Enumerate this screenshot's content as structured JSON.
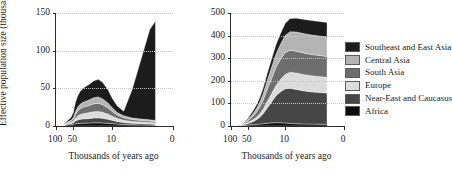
{
  "chart_data": {
    "type": "area",
    "layout": "two-panel stacked area, shared legend at right",
    "title": "",
    "grid": true,
    "legend_position": "right",
    "xlabel": "Thousands of years ago",
    "ylabel": "Effective population size (thousands)",
    "x_tick_labels": [
      "100",
      "50",
      "10",
      "0"
    ],
    "x_tick_values": [
      100,
      50,
      10,
      0
    ],
    "x_axis_note": "reversed, non-linear (log-like) time axis, oldest at left",
    "series_order_bottom_to_top": [
      "Africa",
      "Near-East and Caucasus",
      "Europe",
      "South Asia",
      "Central Asia",
      "Southeast and East Asia"
    ],
    "colors": {
      "Southeast and East Asia": "#1c1c1c",
      "Central Asia": "#b4b4b4",
      "South Asia": "#6e6e6e",
      "Europe": "#dcdcdc",
      "Near-East and Caucasus": "#464646",
      "Africa": "#0d0d0d"
    },
    "panels": [
      {
        "id": "left",
        "ylabel": "Effective population size (thousands)",
        "xlabel": "Thousands of years ago",
        "ylim": [
          0,
          150
        ],
        "y_tick_labels": [
          "0",
          "50",
          "100",
          "150"
        ],
        "y_tick_values": [
          0,
          50,
          100,
          150
        ],
        "peak_total": 140,
        "x": [
          100,
          90,
          80,
          72,
          66,
          60,
          55,
          50,
          46,
          42,
          38,
          34,
          30,
          26,
          22,
          18,
          15,
          12,
          10,
          8,
          6,
          4,
          2.5,
          1.5,
          1
        ],
        "series": [
          {
            "name": "Africa",
            "values": [
              0,
              0,
              0,
              0.4,
              1.2,
              1.6,
              1.8,
              2.2,
              3.0,
              3.4,
              3.6,
              3.8,
              3.8,
              4.0,
              4.2,
              4.2,
              4.0,
              3.6,
              3.2,
              2.6,
              2.0,
              1.6,
              1.4,
              1.2,
              1.0
            ]
          },
          {
            "name": "Near-East and Caucasus",
            "values": [
              0,
              0,
              0,
              0.3,
              1.0,
              1.4,
              1.6,
              2.2,
              3.6,
              4.6,
              5.2,
              5.6,
              5.8,
              6.0,
              6.4,
              6.6,
              6.2,
              5.4,
              4.4,
              3.4,
              2.6,
              2.0,
              1.8,
              1.6,
              1.4
            ]
          },
          {
            "name": "Europe",
            "values": [
              0,
              0,
              0,
              0.2,
              0.8,
              1.2,
              1.4,
              2.2,
              4.0,
              5.4,
              6.4,
              7.0,
              7.4,
              7.8,
              8.4,
              8.6,
              8.0,
              6.8,
              5.4,
              4.0,
              3.0,
              2.4,
              2.0,
              1.8,
              1.6
            ]
          },
          {
            "name": "South Asia",
            "values": [
              0,
              0,
              0,
              0.2,
              0.8,
              1.2,
              1.6,
              2.6,
              4.6,
              6.4,
              7.6,
              8.4,
              9.0,
              9.6,
              10.4,
              10.8,
              10.0,
              8.4,
              6.4,
              4.6,
              3.4,
              2.6,
              2.2,
              2.0,
              1.8
            ]
          },
          {
            "name": "Central Asia",
            "values": [
              0,
              0,
              0,
              0.1,
              0.6,
              0.9,
              1.2,
              2.0,
              3.6,
              5.0,
              6.0,
              6.6,
              7.0,
              7.4,
              8.0,
              8.4,
              7.8,
              6.4,
              4.8,
              3.4,
              2.6,
              2.0,
              1.8,
              1.6,
              1.4
            ]
          },
          {
            "name": "Southeast and East Asia",
            "values": [
              0,
              0,
              0,
              0.3,
              1.2,
              2.4,
              3.6,
              6.8,
              12.0,
              15.0,
              17.0,
              18.4,
              19.6,
              20.6,
              22.4,
              23.4,
              21.6,
              17.6,
              12.8,
              8.6,
              6.0,
              38.0,
              80.0,
              120.0,
              131.8
            ]
          }
        ]
      },
      {
        "id": "right",
        "ylabel": "",
        "xlabel": "Thousands of years ago",
        "ylim": [
          0,
          500
        ],
        "y_tick_labels": [
          "0",
          "100",
          "200",
          "300",
          "400",
          "500"
        ],
        "y_tick_values": [
          0,
          100,
          200,
          300,
          400,
          500
        ],
        "peak_total": 458,
        "x": [
          100,
          90,
          80,
          72,
          66,
          60,
          55,
          50,
          46,
          42,
          38,
          34,
          30,
          26,
          22,
          18,
          15,
          12,
          10,
          8,
          6,
          4,
          2.5,
          1.5,
          1
        ],
        "series": [
          {
            "name": "Africa",
            "values": [
              0,
              0,
              0.3,
              0.8,
              1.6,
              2.4,
              3.2,
              4.2,
              5.0,
              5.6,
              6.4,
              7.4,
              8.6,
              10.4,
              12.4,
              14.0,
              14.6,
              14.2,
              13.0,
              11.4,
              10.0,
              9.0,
              8.4,
              8.0,
              7.8
            ]
          },
          {
            "name": "Near-East and Caucasus",
            "values": [
              0,
              0,
              0.2,
              0.6,
              1.4,
              2.6,
              4.0,
              6.4,
              9.0,
              12.0,
              16.0,
              22.0,
              31.0,
              45.0,
              68.0,
              95.0,
              120.0,
              140.0,
              152.0,
              156.0,
              152.0,
              146.0,
              142.0,
              140.0,
              138.0
            ]
          },
          {
            "name": "Europe",
            "values": [
              0,
              0,
              0.1,
              0.4,
              1.0,
              1.8,
              2.8,
              4.4,
              6.0,
              7.6,
              9.4,
              12.0,
              15.4,
              20.4,
              28.0,
              37.0,
              46.0,
              56.0,
              64.0,
              70.0,
              72.0,
              72.0,
              71.0,
              70.0,
              70.0
            ]
          },
          {
            "name": "South Asia",
            "values": [
              0,
              0,
              0.1,
              0.4,
              1.2,
              2.4,
              4.0,
              7.0,
              10.4,
              14.0,
              18.0,
              23.0,
              30.0,
              40.0,
              54.0,
              68.0,
              80.0,
              90.0,
              96.0,
              98.0,
              97.0,
              95.0,
              94.0,
              93.0,
              92.0
            ]
          },
          {
            "name": "Central Asia",
            "values": [
              0,
              0,
              0.1,
              0.3,
              0.9,
              1.8,
              3.0,
              5.2,
              7.6,
              10.0,
              13.0,
              17.0,
              22.0,
              29.0,
              39.0,
              50.0,
              59.0,
              68.0,
              76.0,
              82.0,
              85.0,
              86.0,
              86.0,
              86.0,
              86.0
            ]
          },
          {
            "name": "Southeast and East Asia",
            "values": [
              0,
              0,
              0.1,
              0.3,
              0.9,
              1.8,
              3.0,
              5.4,
              8.0,
              10.4,
              13.0,
              16.0,
              20.0,
              25.0,
              31.0,
              37.0,
              42.0,
              48.0,
              54.0,
              58.0,
              61.0,
              63.0,
              64.0,
              64.0,
              64.0
            ]
          }
        ]
      }
    ]
  },
  "legend": {
    "items": [
      {
        "label": "Southeast and East Asia",
        "color": "#1c1c1c"
      },
      {
        "label": "Central Asia",
        "color": "#b4b4b4"
      },
      {
        "label": "South Asia",
        "color": "#6e6e6e"
      },
      {
        "label": "Europe",
        "color": "#dcdcdc"
      },
      {
        "label": "Near-East and Caucasus",
        "color": "#464646"
      },
      {
        "label": "Africa",
        "color": "#0d0d0d"
      }
    ]
  }
}
